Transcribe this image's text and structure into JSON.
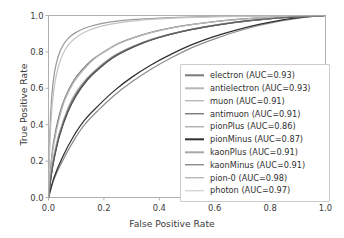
{
  "chart_data": {
    "type": "line",
    "title": "",
    "xlabel": "False Positive Rate",
    "ylabel": "True Positive Rate",
    "xlim": [
      0.0,
      1.0
    ],
    "ylim": [
      0.0,
      1.0
    ],
    "xticks": [
      "0.0",
      "0.2",
      "0.4",
      "0.6",
      "0.8",
      "1.0"
    ],
    "yticks": [
      "0.0",
      "0.2",
      "0.4",
      "0.6",
      "0.8",
      "1.0"
    ],
    "xtick_values": [
      0.0,
      0.2,
      0.4,
      0.6,
      0.8,
      1.0
    ],
    "ytick_values": [
      0.0,
      0.2,
      0.4,
      0.6,
      0.8,
      1.0
    ],
    "grid": false,
    "legend_position": "center right",
    "series": [
      {
        "name": "electron",
        "auc": 0.93,
        "label": "electron (AUC=0.93)",
        "color": "#7a7a7a",
        "x": [
          0.0,
          0.01,
          0.02,
          0.04,
          0.06,
          0.09,
          0.12,
          0.16,
          0.2,
          0.25,
          0.3,
          0.36,
          0.42,
          0.5,
          0.6,
          0.7,
          0.8,
          0.9,
          1.0
        ],
        "y": [
          0.0,
          0.2,
          0.32,
          0.46,
          0.55,
          0.64,
          0.7,
          0.76,
          0.8,
          0.845,
          0.875,
          0.903,
          0.925,
          0.947,
          0.967,
          0.981,
          0.99,
          0.996,
          1.0
        ]
      },
      {
        "name": "antielectron",
        "auc": 0.93,
        "label": "antielectron (AUC=0.93)",
        "color": "#b6b6b6",
        "x": [
          0.0,
          0.01,
          0.02,
          0.04,
          0.06,
          0.09,
          0.12,
          0.16,
          0.2,
          0.25,
          0.3,
          0.36,
          0.42,
          0.5,
          0.6,
          0.7,
          0.8,
          0.9,
          1.0
        ],
        "y": [
          0.0,
          0.19,
          0.3,
          0.44,
          0.54,
          0.63,
          0.69,
          0.755,
          0.8,
          0.843,
          0.873,
          0.902,
          0.924,
          0.946,
          0.966,
          0.98,
          0.99,
          0.996,
          1.0
        ]
      },
      {
        "name": "muon",
        "auc": 0.91,
        "label": "muon (AUC=0.91)",
        "color": "#9c9c9c",
        "x": [
          0.0,
          0.01,
          0.02,
          0.04,
          0.07,
          0.1,
          0.14,
          0.18,
          0.23,
          0.28,
          0.34,
          0.4,
          0.48,
          0.56,
          0.66,
          0.76,
          0.86,
          0.94,
          1.0
        ],
        "y": [
          0.0,
          0.13,
          0.22,
          0.35,
          0.48,
          0.57,
          0.65,
          0.71,
          0.77,
          0.81,
          0.85,
          0.881,
          0.912,
          0.936,
          0.96,
          0.977,
          0.989,
          0.996,
          1.0
        ]
      },
      {
        "name": "antimuon",
        "auc": 0.91,
        "label": "antimuon (AUC=0.91)",
        "color": "#454545",
        "x": [
          0.0,
          0.01,
          0.02,
          0.04,
          0.07,
          0.1,
          0.14,
          0.18,
          0.23,
          0.28,
          0.34,
          0.4,
          0.48,
          0.56,
          0.66,
          0.76,
          0.86,
          0.94,
          1.0
        ],
        "y": [
          0.0,
          0.12,
          0.21,
          0.34,
          0.47,
          0.56,
          0.645,
          0.705,
          0.765,
          0.808,
          0.848,
          0.879,
          0.911,
          0.935,
          0.959,
          0.976,
          0.989,
          0.996,
          1.0
        ]
      },
      {
        "name": "pionPlus",
        "auc": 0.86,
        "label": "pionPlus (AUC=0.86)",
        "color": "#8e8e8e",
        "x": [
          0.0,
          0.02,
          0.05,
          0.09,
          0.13,
          0.18,
          0.24,
          0.3,
          0.37,
          0.44,
          0.52,
          0.6,
          0.68,
          0.76,
          0.84,
          0.9,
          0.95,
          1.0
        ],
        "y": [
          0.0,
          0.1,
          0.2,
          0.31,
          0.4,
          0.48,
          0.565,
          0.635,
          0.705,
          0.765,
          0.825,
          0.872,
          0.912,
          0.945,
          0.971,
          0.985,
          0.994,
          1.0
        ]
      },
      {
        "name": "pionMinus",
        "auc": 0.87,
        "label": "pionMinus (AUC=0.87)",
        "color": "#303030",
        "x": [
          0.0,
          0.02,
          0.05,
          0.09,
          0.13,
          0.18,
          0.24,
          0.3,
          0.37,
          0.44,
          0.52,
          0.6,
          0.68,
          0.76,
          0.84,
          0.9,
          0.95,
          1.0
        ],
        "y": [
          0.0,
          0.11,
          0.22,
          0.335,
          0.425,
          0.505,
          0.59,
          0.66,
          0.728,
          0.785,
          0.841,
          0.885,
          0.921,
          0.951,
          0.975,
          0.987,
          0.995,
          1.0
        ]
      },
      {
        "name": "kaonPlus",
        "auc": 0.91,
        "label": "kaonPlus (AUC=0.91)",
        "color": "#a8a8a8",
        "x": [
          0.0,
          0.01,
          0.02,
          0.04,
          0.07,
          0.1,
          0.14,
          0.18,
          0.23,
          0.28,
          0.34,
          0.4,
          0.48,
          0.56,
          0.66,
          0.76,
          0.86,
          0.94,
          1.0
        ],
        "y": [
          0.0,
          0.14,
          0.235,
          0.36,
          0.49,
          0.58,
          0.657,
          0.715,
          0.773,
          0.814,
          0.853,
          0.883,
          0.913,
          0.937,
          0.961,
          0.977,
          0.989,
          0.996,
          1.0
        ]
      },
      {
        "name": "kaonMinus",
        "auc": 0.91,
        "label": "kaonMinus (AUC=0.91)",
        "color": "#5e5e5e",
        "x": [
          0.0,
          0.01,
          0.02,
          0.04,
          0.07,
          0.1,
          0.14,
          0.18,
          0.23,
          0.28,
          0.34,
          0.4,
          0.48,
          0.56,
          0.66,
          0.76,
          0.86,
          0.94,
          1.0
        ],
        "y": [
          0.0,
          0.125,
          0.215,
          0.345,
          0.475,
          0.565,
          0.65,
          0.708,
          0.768,
          0.81,
          0.85,
          0.88,
          0.911,
          0.936,
          0.96,
          0.977,
          0.989,
          0.996,
          1.0
        ]
      },
      {
        "name": "pion-0",
        "auc": 0.98,
        "label": "pion-0 (AUC=0.98)",
        "color": "#9a9a9a",
        "x": [
          0.0,
          0.005,
          0.012,
          0.022,
          0.035,
          0.05,
          0.07,
          0.095,
          0.13,
          0.17,
          0.22,
          0.3,
          0.4,
          0.5,
          0.65,
          0.8,
          0.9,
          1.0
        ],
        "y": [
          0.0,
          0.36,
          0.56,
          0.69,
          0.775,
          0.83,
          0.873,
          0.903,
          0.93,
          0.949,
          0.963,
          0.977,
          0.986,
          0.991,
          0.996,
          0.998,
          0.999,
          1.0
        ]
      },
      {
        "name": "photon",
        "auc": 0.97,
        "label": "photon (AUC=0.97)",
        "color": "#c4c4c4",
        "x": [
          0.0,
          0.005,
          0.012,
          0.022,
          0.035,
          0.05,
          0.07,
          0.095,
          0.13,
          0.17,
          0.22,
          0.3,
          0.4,
          0.5,
          0.65,
          0.8,
          0.9,
          1.0
        ],
        "y": [
          0.0,
          0.3,
          0.48,
          0.62,
          0.715,
          0.782,
          0.836,
          0.874,
          0.908,
          0.932,
          0.951,
          0.969,
          0.981,
          0.988,
          0.994,
          0.998,
          0.999,
          1.0
        ]
      }
    ]
  },
  "style": {
    "axis_color": "#b0b0b0",
    "tick_text_color": "#3a3a3a",
    "label_color": "#3a3a3a",
    "legend_border_color": "#cccccc",
    "background": "#ffffff"
  }
}
